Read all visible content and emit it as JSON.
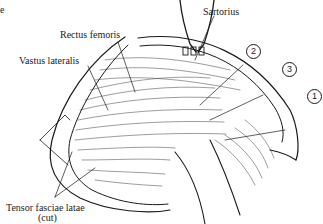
{
  "figure": {
    "type": "anatomical-illustration",
    "partial_text_top_left": "e",
    "labels": {
      "rectus_femoris": "Rectus femoris",
      "vastus_lateralis": "Vastus lateralis",
      "sartorius": "Sartorius",
      "tensor_line1": "Tensor fasciae latae",
      "tensor_line2": "(cut)"
    },
    "callouts": [
      {
        "number": "2"
      },
      {
        "number": "3"
      },
      {
        "number": "1"
      }
    ],
    "colors": {
      "ink": "#1a1a1a",
      "background": "#ffffff"
    }
  }
}
